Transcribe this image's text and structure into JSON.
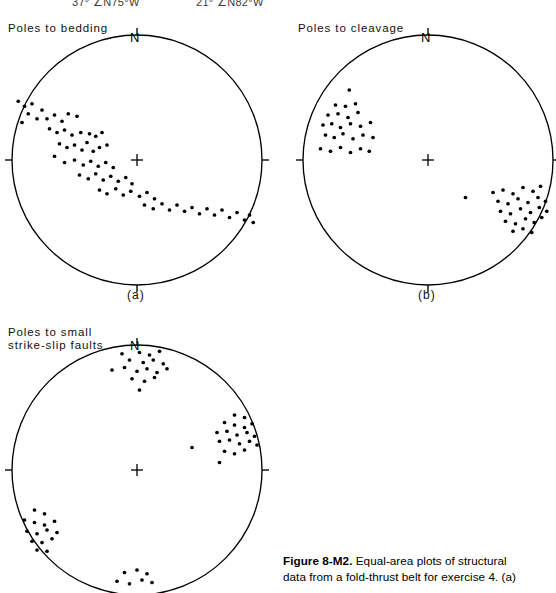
{
  "header_cut": {
    "left_text": "37° ∠N75°W",
    "right_text": "21° ∠N82°W"
  },
  "figure": {
    "caption_bold": "Figure  8-M2.",
    "caption_line1": " Equal-area plots of structural",
    "caption_line2": "data from a fold-thrust belt for exercise 4.  (a)"
  },
  "north_label": "N",
  "panels": [
    {
      "id": "a",
      "title": "Poles to bedding",
      "caption": "(a)",
      "north_label": "N",
      "chart_data": {
        "type": "scatter",
        "projection": "equal-area-lower-hemisphere",
        "title": "Poles to bedding",
        "pattern": "girdle",
        "grid": false,
        "axis_ticks": [
          "N",
          "E",
          "S",
          "W"
        ],
        "radius_normalized": 1.0,
        "point_count": 68,
        "points_xy": [
          [
            -0.95,
            0.47
          ],
          [
            -0.9,
            0.43
          ],
          [
            -0.87,
            0.37
          ],
          [
            -0.84,
            0.45
          ],
          [
            -0.92,
            0.3
          ],
          [
            -0.8,
            0.33
          ],
          [
            -0.76,
            0.4
          ],
          [
            -0.72,
            0.33
          ],
          [
            -0.66,
            0.36
          ],
          [
            -0.6,
            0.31
          ],
          [
            -0.55,
            0.37
          ],
          [
            -0.48,
            0.35
          ],
          [
            -0.7,
            0.25
          ],
          [
            -0.64,
            0.22
          ],
          [
            -0.58,
            0.24
          ],
          [
            -0.52,
            0.2
          ],
          [
            -0.45,
            0.22
          ],
          [
            -0.38,
            0.21
          ],
          [
            -0.33,
            0.19
          ],
          [
            -0.28,
            0.22
          ],
          [
            -0.62,
            0.13
          ],
          [
            -0.56,
            0.1
          ],
          [
            -0.5,
            0.12
          ],
          [
            -0.44,
            0.08
          ],
          [
            -0.4,
            0.14
          ],
          [
            -0.35,
            0.07
          ],
          [
            -0.3,
            0.1
          ],
          [
            -0.24,
            0.12
          ],
          [
            -0.66,
            0.03
          ],
          [
            -0.58,
            -0.02
          ],
          [
            -0.5,
            0.0
          ],
          [
            -0.43,
            -0.04
          ],
          [
            -0.37,
            -0.01
          ],
          [
            -0.31,
            -0.05
          ],
          [
            -0.25,
            -0.02
          ],
          [
            -0.19,
            -0.06
          ],
          [
            -0.46,
            -0.12
          ],
          [
            -0.39,
            -0.15
          ],
          [
            -0.33,
            -0.11
          ],
          [
            -0.27,
            -0.16
          ],
          [
            -0.21,
            -0.13
          ],
          [
            -0.15,
            -0.17
          ],
          [
            -0.09,
            -0.14
          ],
          [
            -0.04,
            -0.19
          ],
          [
            -0.3,
            -0.24
          ],
          [
            -0.24,
            -0.27
          ],
          [
            -0.17,
            -0.23
          ],
          [
            -0.11,
            -0.28
          ],
          [
            -0.05,
            -0.25
          ],
          [
            0.02,
            -0.29
          ],
          [
            0.08,
            -0.26
          ],
          [
            0.14,
            -0.31
          ],
          [
            0.06,
            -0.36
          ],
          [
            0.13,
            -0.39
          ],
          [
            0.2,
            -0.35
          ],
          [
            0.26,
            -0.4
          ],
          [
            0.32,
            -0.36
          ],
          [
            0.38,
            -0.41
          ],
          [
            0.44,
            -0.38
          ],
          [
            0.5,
            -0.43
          ],
          [
            0.56,
            -0.39
          ],
          [
            0.62,
            -0.44
          ],
          [
            0.68,
            -0.4
          ],
          [
            0.74,
            -0.46
          ],
          [
            0.8,
            -0.42
          ],
          [
            0.86,
            -0.48
          ],
          [
            0.9,
            -0.44
          ],
          [
            0.93,
            -0.5
          ]
        ]
      }
    },
    {
      "id": "b",
      "title": "Poles to cleavage",
      "caption": "(b)",
      "north_label": "N",
      "chart_data": {
        "type": "scatter",
        "projection": "equal-area-lower-hemisphere",
        "title": "Poles to cleavage",
        "pattern": "bipolar-clusters",
        "grid": false,
        "axis_ticks": [
          "N",
          "E",
          "S",
          "W"
        ],
        "radius_normalized": 1.0,
        "point_count": 53,
        "points_xy": [
          [
            -0.63,
            0.56
          ],
          [
            -0.74,
            0.44
          ],
          [
            -0.66,
            0.43
          ],
          [
            -0.58,
            0.45
          ],
          [
            -0.8,
            0.36
          ],
          [
            -0.72,
            0.37
          ],
          [
            -0.64,
            0.34
          ],
          [
            -0.56,
            0.38
          ],
          [
            -0.84,
            0.28
          ],
          [
            -0.77,
            0.29
          ],
          [
            -0.7,
            0.26
          ],
          [
            -0.62,
            0.29
          ],
          [
            -0.54,
            0.27
          ],
          [
            -0.46,
            0.3
          ],
          [
            -0.82,
            0.2
          ],
          [
            -0.75,
            0.18
          ],
          [
            -0.68,
            0.21
          ],
          [
            -0.6,
            0.17
          ],
          [
            -0.52,
            0.2
          ],
          [
            -0.44,
            0.18
          ],
          [
            -0.86,
            0.09
          ],
          [
            -0.78,
            0.07
          ],
          [
            -0.7,
            0.1
          ],
          [
            -0.62,
            0.06
          ],
          [
            -0.54,
            0.09
          ],
          [
            -0.47,
            0.07
          ],
          [
            0.3,
            -0.3
          ],
          [
            0.52,
            -0.26
          ],
          [
            0.6,
            -0.24
          ],
          [
            0.68,
            -0.27
          ],
          [
            0.76,
            -0.22
          ],
          [
            0.84,
            -0.25
          ],
          [
            0.9,
            -0.21
          ],
          [
            0.56,
            -0.33
          ],
          [
            0.64,
            -0.35
          ],
          [
            0.72,
            -0.31
          ],
          [
            0.8,
            -0.34
          ],
          [
            0.88,
            -0.3
          ],
          [
            0.94,
            -0.33
          ],
          [
            0.58,
            -0.41
          ],
          [
            0.66,
            -0.43
          ],
          [
            0.74,
            -0.39
          ],
          [
            0.82,
            -0.42
          ],
          [
            0.89,
            -0.38
          ],
          [
            0.95,
            -0.41
          ],
          [
            0.62,
            -0.49
          ],
          [
            0.7,
            -0.51
          ],
          [
            0.78,
            -0.47
          ],
          [
            0.85,
            -0.5
          ],
          [
            0.91,
            -0.46
          ],
          [
            0.68,
            -0.57
          ],
          [
            0.76,
            -0.55
          ],
          [
            0.83,
            -0.58
          ]
        ]
      }
    },
    {
      "id": "c",
      "title": "Poles to small\n strike-slip faults",
      "caption": "",
      "north_label": "N",
      "chart_data": {
        "type": "scatter",
        "projection": "equal-area-lower-hemisphere",
        "title": "Poles to small strike-slip faults",
        "pattern": "four-clusters",
        "grid": false,
        "axis_ticks": [
          "N",
          "E",
          "S",
          "W"
        ],
        "radius_normalized": 1.0,
        "point_count": 62,
        "points_xy": [
          [
            -0.12,
            0.93
          ],
          [
            0.02,
            0.94
          ],
          [
            0.1,
            0.92
          ],
          [
            0.18,
            0.95
          ],
          [
            -0.06,
            0.88
          ],
          [
            0.05,
            0.86
          ],
          [
            0.13,
            0.88
          ],
          [
            0.21,
            0.85
          ],
          [
            -0.2,
            0.8
          ],
          [
            -0.1,
            0.82
          ],
          [
            0.0,
            0.79
          ],
          [
            0.08,
            0.81
          ],
          [
            0.16,
            0.78
          ],
          [
            0.24,
            0.81
          ],
          [
            -0.04,
            0.73
          ],
          [
            0.06,
            0.71
          ],
          [
            0.14,
            0.74
          ],
          [
            0.02,
            0.64
          ],
          [
            0.78,
            0.44
          ],
          [
            0.86,
            0.42
          ],
          [
            0.7,
            0.38
          ],
          [
            0.78,
            0.36
          ],
          [
            0.86,
            0.34
          ],
          [
            0.92,
            0.37
          ],
          [
            0.64,
            0.3
          ],
          [
            0.72,
            0.31
          ],
          [
            0.8,
            0.28
          ],
          [
            0.88,
            0.3
          ],
          [
            0.94,
            0.27
          ],
          [
            0.66,
            0.23
          ],
          [
            0.74,
            0.24
          ],
          [
            0.82,
            0.21
          ],
          [
            0.9,
            0.23
          ],
          [
            0.96,
            0.2
          ],
          [
            0.44,
            0.18
          ],
          [
            0.7,
            0.15
          ],
          [
            0.78,
            0.13
          ],
          [
            0.86,
            0.16
          ],
          [
            0.66,
            0.06
          ],
          [
            -0.82,
            -0.32
          ],
          [
            -0.74,
            -0.35
          ],
          [
            -0.9,
            -0.4
          ],
          [
            -0.82,
            -0.42
          ],
          [
            -0.74,
            -0.44
          ],
          [
            -0.66,
            -0.41
          ],
          [
            -0.88,
            -0.49
          ],
          [
            -0.8,
            -0.51
          ],
          [
            -0.72,
            -0.48
          ],
          [
            -0.64,
            -0.5
          ],
          [
            -0.84,
            -0.57
          ],
          [
            -0.76,
            -0.58
          ],
          [
            -0.68,
            -0.55
          ],
          [
            -0.8,
            -0.64
          ],
          [
            -0.72,
            -0.65
          ],
          [
            -0.1,
            -0.82
          ],
          [
            0.0,
            -0.8
          ],
          [
            0.08,
            -0.83
          ],
          [
            -0.16,
            -0.89
          ],
          [
            -0.06,
            -0.91
          ],
          [
            0.04,
            -0.88
          ],
          [
            0.12,
            -0.9
          ]
        ]
      }
    }
  ]
}
